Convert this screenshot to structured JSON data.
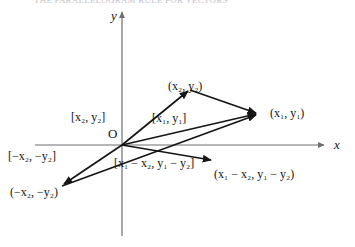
{
  "figure": {
    "caption_clipped": "THE PARALLELOGRAM RULE FOR VECTORS",
    "axes": {
      "y_label": "y",
      "x_label": "x",
      "origin_label": "O"
    },
    "points": [
      {
        "id": "p-x2y2",
        "text": "(x2, y2)",
        "display": "(x₂, y₂)",
        "x": 168,
        "y": 80
      },
      {
        "id": "p-x1y1",
        "text": "(x1, y1)",
        "display": "(x₁, y₁)",
        "x": 270,
        "y": 107
      },
      {
        "id": "p-neg-x2y2",
        "text": "(-x2, -y2)",
        "display": "(−x₂, −y₂)",
        "x": 10,
        "y": 186
      },
      {
        "id": "p-diff",
        "text": "(x1 - x2, y1 - y2)",
        "display": "(x₁ − x₂, y₁ − y₂)",
        "x": 214,
        "y": 168
      }
    ],
    "vector_labels": [
      {
        "id": "v-x2y2",
        "text": "[x2, y2]",
        "display": "[x₂, y₂]",
        "x": 71,
        "y": 111
      },
      {
        "id": "v-x1y1",
        "text": "[x1, y1]",
        "display": "[x₁, y₁]",
        "x": 152,
        "y": 112
      },
      {
        "id": "v-neg-x2y2",
        "text": "[-x2, -y2]",
        "display": "[−x₂, −y₂]",
        "x": 8,
        "y": 150
      },
      {
        "id": "v-diff",
        "text": "[x1 - x2, y1 - y2]",
        "display": "[x₁ − x₂, y₁ − y₂]",
        "x": 114,
        "y": 157
      }
    ],
    "geometry": {
      "origin": {
        "x": 122,
        "y": 145
      },
      "y_axis": {
        "x": 122,
        "top": 10,
        "bottom": 236
      },
      "x_axis": {
        "y": 145,
        "left": 35,
        "right": 326
      },
      "vertex_x2y2": {
        "x": 190,
        "y": 90
      },
      "vertex_x1y1": {
        "x": 259,
        "y": 113
      },
      "vertex_neg_x2y2": {
        "x": 62,
        "y": 186
      },
      "vertex_diff": {
        "x": 213,
        "y": 160
      }
    },
    "colors": {
      "ink": "#151515",
      "axis": "#6f6f72",
      "paper": "#ffffff"
    }
  }
}
